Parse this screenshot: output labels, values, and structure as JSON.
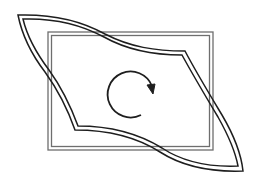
{
  "diagram": {
    "title": "Rectangle with twisted (sheared) overlay shape and clockwise rotation arrow",
    "colors": {
      "background": "#ffffff",
      "rectangle_stroke": "#6e6e6e",
      "shape_stroke": "#1e1e1e",
      "arrow_stroke": "#1e1e1e"
    },
    "rectangle": {
      "outer": {
        "x": 48,
        "y": 32,
        "width": 165,
        "height": 118
      },
      "inner": {
        "x": 51,
        "y": 35,
        "width": 159,
        "height": 112
      }
    },
    "twisted_shape": {
      "tip_top_left": [
        18,
        16
      ],
      "tip_bottom_right": [
        242,
        170
      ],
      "corner_upper_right": [
        184,
        52
      ],
      "corner_lower_left": [
        75,
        133
      ]
    },
    "rotation_arrow": {
      "center": [
        133,
        93
      ],
      "radius": 23,
      "direction": "clockwise"
    }
  }
}
